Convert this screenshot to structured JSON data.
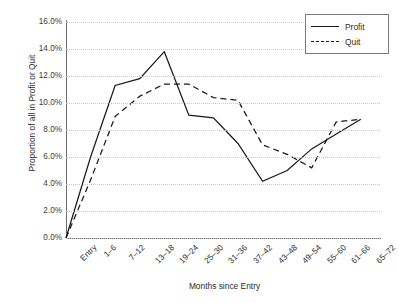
{
  "chart_data": {
    "type": "line",
    "title": "",
    "xlabel": "Months since Entry",
    "ylabel": "Proportion of all in Profit or Quit",
    "categories": [
      "Entry",
      "1–6",
      "7–12",
      "13–18",
      "19–24",
      "25–30",
      "31–36",
      "37–42",
      "43–48",
      "49–54",
      "55–60",
      "61–66",
      "65–72"
    ],
    "ylim": [
      0,
      16
    ],
    "ytick_step": 2,
    "ytick_labels": [
      "16.0%",
      "14.0%",
      "12.0%",
      "10.0%",
      "8.0%",
      "6.0%",
      "4.0%",
      "2.0%",
      "0.0%"
    ],
    "ytick_values": [
      16,
      14,
      12,
      10,
      8,
      6,
      4,
      2,
      0
    ],
    "grid": true,
    "legend_position": "top-right",
    "series": [
      {
        "name": "Profit",
        "style": "solid",
        "color": "#1a1a1a",
        "values": [
          0.0,
          6.0,
          11.3,
          11.8,
          13.8,
          9.1,
          8.9,
          7.0,
          4.2,
          5.0,
          6.6,
          7.7,
          8.8
        ]
      },
      {
        "name": "Quit",
        "style": "dashed",
        "color": "#1a1a1a",
        "values": [
          0.0,
          4.3,
          9.0,
          10.5,
          11.4,
          11.4,
          10.4,
          10.2,
          6.9,
          6.2,
          5.2,
          8.6,
          8.8
        ]
      }
    ]
  },
  "legend": {
    "items": [
      {
        "label": "Profit"
      },
      {
        "label": "Quit"
      }
    ]
  }
}
